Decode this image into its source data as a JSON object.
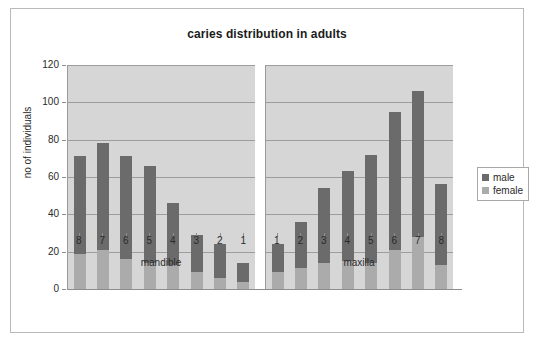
{
  "chart_data": {
    "type": "bar",
    "title": "caries distribution in adults",
    "xlabel": "",
    "ylabel": "no of individuals",
    "ylim": [
      0,
      120
    ],
    "ytick_labels": [
      "120",
      "100",
      "80",
      "60",
      "40",
      "20",
      "0"
    ],
    "ytick_values": [
      120,
      100,
      80,
      60,
      40,
      20,
      0
    ],
    "grid": true,
    "stacked": true,
    "legend_position": "right",
    "legend": [
      "male",
      "female"
    ],
    "series": [
      {
        "name": "male",
        "color": "#6b6b6b",
        "values": [
          52,
          57,
          55,
          52,
          33,
          20,
          18,
          10,
          15,
          25,
          40,
          48,
          58,
          74,
          78,
          43
        ]
      },
      {
        "name": "female",
        "color": "#ababab",
        "values": [
          19,
          21,
          16,
          14,
          13,
          9,
          6,
          4,
          9,
          11,
          14,
          15,
          14,
          21,
          28,
          13
        ]
      }
    ],
    "totals": [
      71,
      78,
      71,
      66,
      46,
      29,
      24,
      14,
      24,
      36,
      54,
      63,
      72,
      95,
      106,
      56
    ],
    "groups": [
      {
        "label": "mandible",
        "categories": [
          "8",
          "7",
          "6",
          "5",
          "4",
          "3",
          "2",
          "1"
        ],
        "male": [
          52,
          57,
          55,
          52,
          33,
          20,
          18,
          10
        ],
        "female": [
          19,
          21,
          16,
          14,
          13,
          9,
          6,
          4
        ],
        "totals": [
          71,
          78,
          71,
          66,
          46,
          29,
          24,
          14
        ]
      },
      {
        "label": "maxilla",
        "categories": [
          "1",
          "2",
          "3",
          "4",
          "5",
          "6",
          "7",
          "8"
        ],
        "male": [
          15,
          25,
          40,
          48,
          58,
          74,
          78,
          43
        ],
        "female": [
          9,
          11,
          14,
          15,
          14,
          21,
          28,
          13
        ],
        "totals": [
          24,
          36,
          54,
          63,
          72,
          95,
          106,
          56
        ]
      }
    ]
  },
  "colors": {
    "male": "#6b6b6b",
    "female": "#ababab",
    "plot_background": "#d6d6d6",
    "gridline": "#9d9d9d",
    "frame_border": "#b9b9b9",
    "text": "#2a2a2a"
  }
}
